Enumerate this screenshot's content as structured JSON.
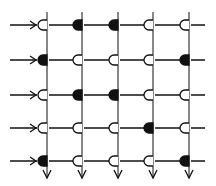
{
  "diagram": {
    "type": "crossbar-array",
    "rows": 5,
    "cols": 5,
    "colors": {
      "ink": "#111111",
      "background": "#ffffff"
    },
    "geometry": {
      "col_x": [
        47,
        82,
        118,
        153,
        189
      ],
      "row_y": [
        25,
        60,
        95,
        128,
        161
      ],
      "grid_top": 12,
      "grid_bottom": 178,
      "input_start_x": 10,
      "output_end_x": 205
    },
    "legend": {
      "filled": "filled-junction",
      "open": "open-junction"
    },
    "cells": [
      [
        "open",
        "filled",
        "filled",
        "open",
        "open"
      ],
      [
        "filled",
        "open",
        "open",
        "open",
        "filled"
      ],
      [
        "open",
        "filled",
        "filled",
        "open",
        "open"
      ],
      [
        "open",
        "open",
        "open",
        "filled",
        "open"
      ],
      [
        "filled",
        "open",
        "open",
        "open",
        "filled"
      ]
    ]
  }
}
